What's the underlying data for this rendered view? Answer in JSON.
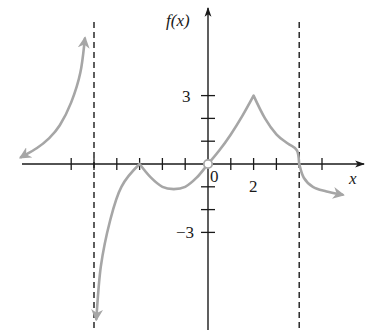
{
  "chart_data": {
    "type": "line",
    "title": "",
    "xlabel": "x",
    "ylabel": "f(x)",
    "xlim": [
      -8.3,
      6.8
    ],
    "ylim": [
      -7.3,
      7.0
    ],
    "grid": false,
    "legend": null,
    "x_tick_positions": [
      -6,
      -5,
      -4,
      -3,
      -2,
      -1,
      1,
      2,
      3,
      5
    ],
    "x_tick_labels": [
      {
        "x": 0,
        "label": "0"
      },
      {
        "x": 2,
        "label": "2"
      }
    ],
    "y_tick_positions": [
      -3,
      -2,
      -1,
      1,
      2,
      3
    ],
    "y_tick_labels": [
      {
        "y": 3,
        "label": "3"
      },
      {
        "y": -3,
        "label": "−3"
      }
    ],
    "vertical_asymptotes": [
      -5,
      4
    ],
    "open_points": [
      {
        "x": 0,
        "y": 0
      }
    ],
    "series": [
      {
        "name": "branch-left",
        "description": "x < -5, rises toward +infinity approaching asymptote x=-5; arrow on both ends",
        "x": [
          -8.2,
          -7.5,
          -7.0,
          -6.5,
          -6.0,
          -5.6,
          -5.4
        ],
        "y": [
          0.3,
          0.7,
          1.1,
          1.7,
          2.7,
          4.0,
          5.5
        ],
        "arrows": [
          "start",
          "end"
        ]
      },
      {
        "name": "branch-middle",
        "description": "-5 < x < 4: from -infinity near x=-5 up to cusp at (-3,0), dips to min near (-1.5,-1.1), passes through open point (0,0), cusp peak at (2,3), descends to (4,0)",
        "x": [
          -4.9,
          -4.7,
          -4.3,
          -3.8,
          -3.0,
          -2.5,
          -2.0,
          -1.5,
          -1.0,
          -0.5,
          0,
          0.5,
          1.0,
          1.5,
          2.0,
          2.5,
          3.0,
          3.5,
          3.9,
          4.0
        ],
        "y": [
          -6.8,
          -4.5,
          -2.5,
          -1.0,
          0,
          -0.6,
          -1.0,
          -1.1,
          -1.0,
          -0.6,
          0,
          0.6,
          1.3,
          2.1,
          3.0,
          2.0,
          1.3,
          0.9,
          0.6,
          0
        ],
        "arrows": [
          "start"
        ]
      },
      {
        "name": "branch-right",
        "description": "x > 4: from (4,0) curving downward toward the right; arrow at end",
        "x": [
          4.0,
          4.2,
          4.6,
          5.2,
          5.9
        ],
        "y": [
          0,
          -0.6,
          -1.0,
          -1.2,
          -1.35
        ],
        "arrows": [
          "end"
        ]
      }
    ],
    "key_points": [
      {
        "x": -3,
        "y": 0,
        "note": "cusp on x-axis"
      },
      {
        "x": 0,
        "y": 0,
        "note": "open circle"
      },
      {
        "x": 2,
        "y": 3,
        "note": "cusp peak"
      },
      {
        "x": 4,
        "y": 0,
        "note": "curve meets asymptote line at x-axis"
      }
    ]
  },
  "labels": {
    "y_axis": "f(x)",
    "x_axis": "x",
    "origin": "0",
    "x_two": "2",
    "y_three": "3",
    "y_neg_three": "−3"
  },
  "colors": {
    "axis": "#1a1a1a",
    "curve": "#a6a6a6",
    "background": "#ffffff"
  }
}
